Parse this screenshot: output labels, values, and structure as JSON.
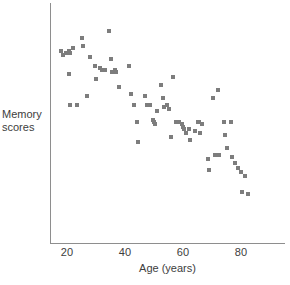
{
  "chart_data": {
    "type": "scatter",
    "title": "",
    "xlabel": "Age (years)",
    "ylabel": "Memory scores",
    "ylabel_lines": [
      "Memory",
      "scores"
    ],
    "xticks": [
      20,
      40,
      60,
      80
    ],
    "xtick_labels": [
      "20",
      "40",
      "60",
      "80"
    ],
    "yticks": [],
    "ytick_labels": [],
    "xlim": [
      14,
      95
    ],
    "ylim": [
      0,
      100
    ],
    "grid": false,
    "legend": false,
    "marker": "square",
    "marker_color": "#7d7d7d",
    "axis_color": "#8e8e8e",
    "background": "#ffffff",
    "points": [
      {
        "x": 18,
        "y": 85
      },
      {
        "x": 18.5,
        "y": 83
      },
      {
        "x": 19.5,
        "y": 84
      },
      {
        "x": 20.5,
        "y": 85
      },
      {
        "x": 21,
        "y": 84
      },
      {
        "x": 22,
        "y": 86
      },
      {
        "x": 25,
        "y": 91
      },
      {
        "x": 25.5,
        "y": 87
      },
      {
        "x": 20.5,
        "y": 74
      },
      {
        "x": 21,
        "y": 60
      },
      {
        "x": 23.5,
        "y": 60
      },
      {
        "x": 27,
        "y": 64
      },
      {
        "x": 28,
        "y": 82
      },
      {
        "x": 29.5,
        "y": 78
      },
      {
        "x": 30,
        "y": 72
      },
      {
        "x": 31.5,
        "y": 77
      },
      {
        "x": 32,
        "y": 76
      },
      {
        "x": 33,
        "y": 76
      },
      {
        "x": 34.5,
        "y": 94
      },
      {
        "x": 35,
        "y": 81
      },
      {
        "x": 35.5,
        "y": 75
      },
      {
        "x": 36,
        "y": 75
      },
      {
        "x": 36.5,
        "y": 76
      },
      {
        "x": 37,
        "y": 75
      },
      {
        "x": 38,
        "y": 68
      },
      {
        "x": 41.5,
        "y": 78
      },
      {
        "x": 42,
        "y": 65
      },
      {
        "x": 43,
        "y": 60
      },
      {
        "x": 44,
        "y": 52
      },
      {
        "x": 44.5,
        "y": 43
      },
      {
        "x": 47,
        "y": 64
      },
      {
        "x": 47.5,
        "y": 60
      },
      {
        "x": 48.5,
        "y": 60
      },
      {
        "x": 49.5,
        "y": 53
      },
      {
        "x": 50,
        "y": 52
      },
      {
        "x": 50.5,
        "y": 51
      },
      {
        "x": 51,
        "y": 57
      },
      {
        "x": 52.5,
        "y": 69
      },
      {
        "x": 53,
        "y": 63
      },
      {
        "x": 53.5,
        "y": 59
      },
      {
        "x": 54.5,
        "y": 60
      },
      {
        "x": 55,
        "y": 58
      },
      {
        "x": 56.5,
        "y": 73
      },
      {
        "x": 56,
        "y": 45
      },
      {
        "x": 57.5,
        "y": 52
      },
      {
        "x": 58.5,
        "y": 52
      },
      {
        "x": 59.5,
        "y": 51
      },
      {
        "x": 60,
        "y": 50
      },
      {
        "x": 60.5,
        "y": 49
      },
      {
        "x": 61,
        "y": 47
      },
      {
        "x": 62,
        "y": 49
      },
      {
        "x": 62.5,
        "y": 44
      },
      {
        "x": 64,
        "y": 48
      },
      {
        "x": 65,
        "y": 52
      },
      {
        "x": 65.5,
        "y": 52
      },
      {
        "x": 66,
        "y": 47
      },
      {
        "x": 66.5,
        "y": 51
      },
      {
        "x": 68.5,
        "y": 35
      },
      {
        "x": 69,
        "y": 30
      },
      {
        "x": 70.5,
        "y": 63
      },
      {
        "x": 71,
        "y": 37
      },
      {
        "x": 72,
        "y": 67
      },
      {
        "x": 72.5,
        "y": 37
      },
      {
        "x": 74,
        "y": 52
      },
      {
        "x": 74.5,
        "y": 46
      },
      {
        "x": 75,
        "y": 40
      },
      {
        "x": 76.5,
        "y": 52
      },
      {
        "x": 77,
        "y": 36
      },
      {
        "x": 78,
        "y": 33
      },
      {
        "x": 79,
        "y": 31
      },
      {
        "x": 80,
        "y": 29
      },
      {
        "x": 80.5,
        "y": 20
      },
      {
        "x": 81.5,
        "y": 27
      },
      {
        "x": 82.5,
        "y": 19
      }
    ]
  }
}
